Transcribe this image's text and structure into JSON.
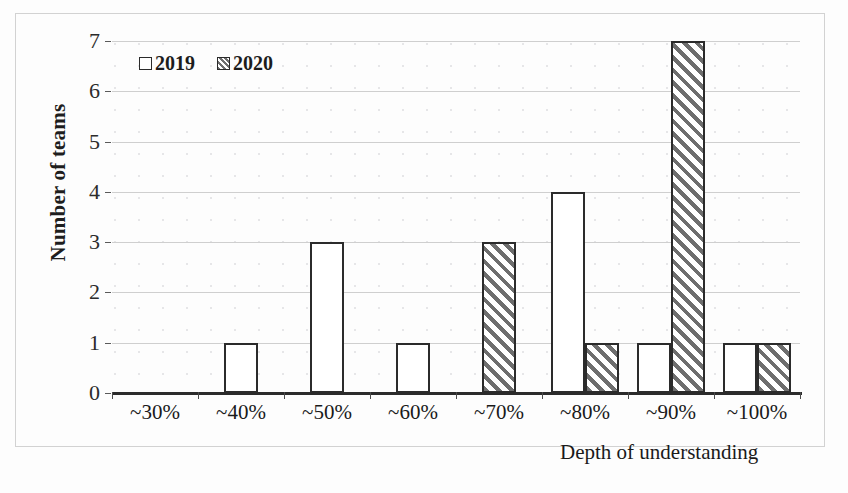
{
  "chart_data": {
    "type": "bar",
    "title": "",
    "xlabel": "Depth of understanding",
    "ylabel": "Number of teams",
    "categories": [
      "~30%",
      "~40%",
      "~50%",
      "~60%",
      "~70%",
      "~80%",
      "~90%",
      "~100%"
    ],
    "series": [
      {
        "name": "2019",
        "values": [
          0,
          1,
          3,
          1,
          0,
          4,
          1,
          1
        ]
      },
      {
        "name": "2020",
        "values": [
          0,
          0,
          0,
          0,
          3,
          1,
          7,
          1
        ]
      }
    ],
    "ylim": [
      0,
      7
    ],
    "yticks": [
      0,
      1,
      2,
      3,
      4,
      5,
      6,
      7
    ],
    "ytick_labels": [
      "0",
      "1",
      "2",
      "3",
      "4",
      "5",
      "6",
      "7"
    ],
    "grid": "horizontal",
    "legend_position": "top-left",
    "legend_entries": [
      "2019",
      "2020"
    ],
    "colors": {
      "series_2019_fill": "#ffffff",
      "series_2020_fill": "#ffffff",
      "series_2020_hatch": "#6e6e6e",
      "bar_outline": "#2b2b2b",
      "gridline": "#cfcfcf",
      "axis": "#2b2b2b",
      "background": "#fdfdfd",
      "text": "#1a1a1a"
    }
  }
}
